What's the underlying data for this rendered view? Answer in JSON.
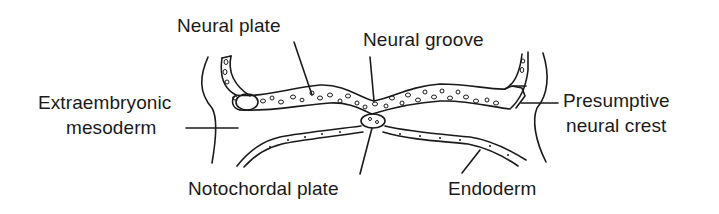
{
  "diagram": {
    "type": "biological cross-section (neurulation stage)",
    "labels": {
      "neural_plate": "Neural plate",
      "neural_groove": "Neural groove",
      "extraembryonic_line1": "Extraembryonic",
      "extraembryonic_line2": "mesoderm",
      "presumptive_line1": "Presumptive",
      "presumptive_line2": "neural crest",
      "notochordal_plate": "Notochordal plate",
      "endoderm": "Endoderm"
    },
    "colors": {
      "ink": "#1a1a1a",
      "background": "#ffffff"
    }
  }
}
